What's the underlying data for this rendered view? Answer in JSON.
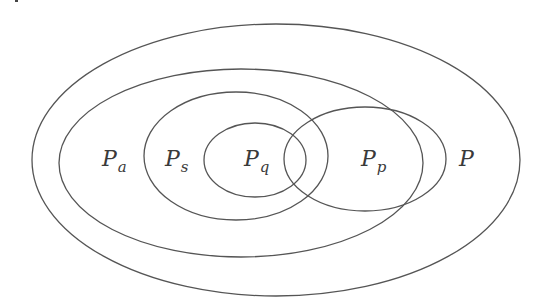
{
  "diagram": {
    "type": "nested-sets",
    "stroke_color": "#555555",
    "sets": [
      {
        "id": "P",
        "label": "P",
        "subscript": "",
        "shape": {
          "cx": 276,
          "cy": 160,
          "rx": 244,
          "ry": 136
        },
        "label_pos": {
          "x": 459,
          "y": 148
        }
      },
      {
        "id": "Pa",
        "label": "P",
        "subscript": "a",
        "shape": {
          "cx": 241,
          "cy": 163,
          "rx": 182,
          "ry": 94
        },
        "label_pos": {
          "x": 102,
          "y": 148
        }
      },
      {
        "id": "Ps",
        "label": "P",
        "subscript": "s",
        "shape": {
          "cx": 236,
          "cy": 156,
          "rx": 92,
          "ry": 64
        },
        "label_pos": {
          "x": 165,
          "y": 148
        }
      },
      {
        "id": "Pq",
        "label": "P",
        "subscript": "q",
        "shape": {
          "cx": 255,
          "cy": 160,
          "rx": 51,
          "ry": 37
        },
        "label_pos": {
          "x": 244,
          "y": 148
        }
      },
      {
        "id": "Pp",
        "label": "P",
        "subscript": "p",
        "shape": {
          "cx": 365,
          "cy": 159,
          "rx": 81,
          "ry": 52
        },
        "label_pos": {
          "x": 361,
          "y": 148
        }
      }
    ],
    "labels": {
      "P": {
        "main": "P",
        "sub": ""
      },
      "Pa": {
        "main": "P",
        "sub": "a"
      },
      "Ps": {
        "main": "P",
        "sub": "s"
      },
      "Pq": {
        "main": "P",
        "sub": "q"
      },
      "Pp": {
        "main": "P",
        "sub": "p"
      }
    }
  }
}
